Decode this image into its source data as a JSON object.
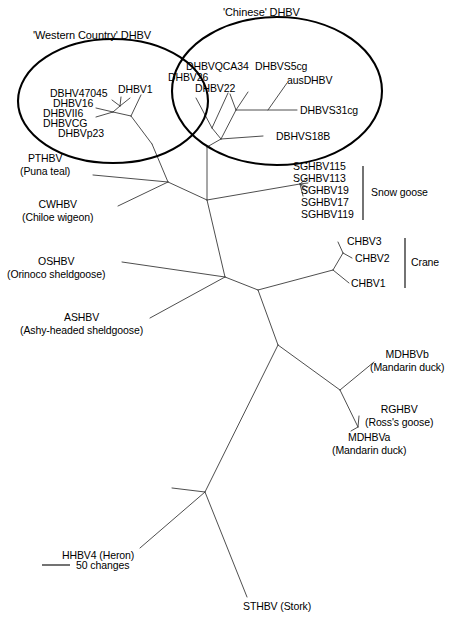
{
  "figure": {
    "type": "unrooted-phylogenetic-tree",
    "background": "#ffffff",
    "line_color": "#3a3a3a",
    "ellipse_color": "#000000",
    "width": 464,
    "height": 620
  },
  "group_titles": {
    "western": "'Western Country' DHBV",
    "chinese": "'Chinese' DHBV"
  },
  "bracket_labels": {
    "snow_goose": "Snow goose",
    "crane": "Crane"
  },
  "scale": {
    "label": "50 changes"
  },
  "taxa": {
    "western": [
      {
        "id": "dbhv47045",
        "label": "DBHV47045"
      },
      {
        "id": "dhbv16",
        "label": "DHBV16"
      },
      {
        "id": "dhbvii6",
        "label": "DHBVII6"
      },
      {
        "id": "dhbvcg",
        "label": "DHBVCG"
      },
      {
        "id": "dhbvp23",
        "label": "DHBVp23"
      },
      {
        "id": "dhbv1",
        "label": "DHBV1"
      }
    ],
    "chinese": [
      {
        "id": "dhbvqca34",
        "label": "DHBVQCA34"
      },
      {
        "id": "dhbvs5cg",
        "label": "DHBVS5cg"
      },
      {
        "id": "dhbv26",
        "label": "DHBV26"
      },
      {
        "id": "dhbv22",
        "label": "DHBV22"
      },
      {
        "id": "ausdhbv",
        "label": "ausDHBV"
      },
      {
        "id": "dhbvs31cg",
        "label": "DHBVS31cg"
      },
      {
        "id": "dbhvs18b",
        "label": "DBHVS18B"
      }
    ],
    "snow_goose": [
      {
        "id": "sghbv115",
        "label": "SGHBV115"
      },
      {
        "id": "sghbv113",
        "label": "SGHBV113"
      },
      {
        "id": "sghbv19",
        "label": "SGHBV19"
      },
      {
        "id": "sghbv17",
        "label": "SGHBV17"
      },
      {
        "id": "sghbv119",
        "label": "SGHBV119"
      }
    ],
    "crane": [
      {
        "id": "chbv3",
        "label": "CHBV3"
      },
      {
        "id": "chbv2",
        "label": "CHBV2"
      },
      {
        "id": "chbv1",
        "label": "CHBV1"
      }
    ],
    "others": [
      {
        "id": "pthbv",
        "label": "PTHBV",
        "common": "(Puna teal)"
      },
      {
        "id": "cwhbv",
        "label": "CWHBV",
        "common": "(Chiloe wigeon)"
      },
      {
        "id": "oshbv",
        "label": "OSHBV",
        "common": "(Orinoco sheldgoose)"
      },
      {
        "id": "ashbv",
        "label": "ASHBV",
        "common": "(Ashy-headed sheldgoose)"
      },
      {
        "id": "mdhbvb",
        "label": "MDHBVb",
        "common": "(Mandarin duck)"
      },
      {
        "id": "rghbv",
        "label": "RGHBV",
        "common": "(Ross's goose)"
      },
      {
        "id": "mdhbva",
        "label": "MDHBVa",
        "common": "(Mandarin duck)"
      },
      {
        "id": "hhbv4",
        "label": "HHBV4 (Heron)"
      },
      {
        "id": "sthbv",
        "label": "STHBV (Stork)"
      }
    ]
  }
}
